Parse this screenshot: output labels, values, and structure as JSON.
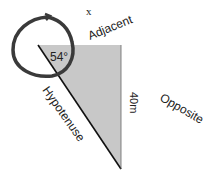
{
  "diagram": {
    "variable_label": "x",
    "angle_label": "54°",
    "sides": {
      "adjacent": "Adjacent",
      "opposite": "Opposite",
      "hypotenuse": "Hypotenuse",
      "opposite_length": "40m"
    },
    "colors": {
      "triangle_fill": "#c8c8c8",
      "circle_stroke": "#3a3a3a",
      "text": "#222222"
    }
  }
}
